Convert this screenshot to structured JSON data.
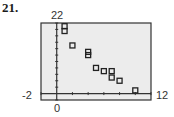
{
  "problem_number": "21.",
  "chart_data": {
    "type": "scatter",
    "title": "",
    "xlabel": "",
    "ylabel": "",
    "xlim": [
      -2,
      12
    ],
    "ylim": [
      -2,
      22
    ],
    "window_labels": {
      "ymax": "22",
      "xmin": "-2",
      "xmax": "12",
      "origin": "0"
    },
    "x_tick_step": 2,
    "y_tick_step": 2,
    "grid": false,
    "points": [
      {
        "x": 1,
        "y": 21
      },
      {
        "x": 1,
        "y": 19.5
      },
      {
        "x": 2,
        "y": 15
      },
      {
        "x": 4,
        "y": 13
      },
      {
        "x": 4,
        "y": 12
      },
      {
        "x": 5,
        "y": 8
      },
      {
        "x": 6,
        "y": 7
      },
      {
        "x": 7,
        "y": 7
      },
      {
        "x": 7,
        "y": 5
      },
      {
        "x": 8,
        "y": 4
      },
      {
        "x": 10,
        "y": 1
      }
    ],
    "colors": {
      "background": "#ececec",
      "frame": "#333333",
      "marker": "#222222"
    }
  }
}
